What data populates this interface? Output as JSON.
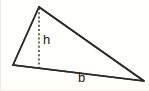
{
  "figure": {
    "type": "geometry-diagram",
    "shape": "triangle",
    "background_color": "#fffffb",
    "stroke_color": "#2b2b27",
    "label_color": "#17171a",
    "canvas": {
      "width": 149,
      "height": 91
    },
    "vertices": [
      {
        "name": "left-vertex",
        "x": 13,
        "y": 65
      },
      {
        "name": "apex-vertex",
        "x": 39,
        "y": 7
      },
      {
        "name": "right-vertex",
        "x": 144,
        "y": 81
      }
    ],
    "edges": [
      {
        "name": "left-side",
        "from": "left-vertex",
        "to": "apex-vertex"
      },
      {
        "name": "hypotenuse-side",
        "from": "apex-vertex",
        "to": "right-vertex"
      },
      {
        "name": "base-side",
        "from": "left-vertex",
        "to": "right-vertex"
      }
    ],
    "altitude": {
      "name": "height-segment",
      "style": "dashed",
      "from": {
        "x": 39,
        "y": 7
      },
      "to": {
        "x": 39,
        "y": 68
      }
    },
    "labels": {
      "height": "h",
      "base": "b"
    }
  }
}
